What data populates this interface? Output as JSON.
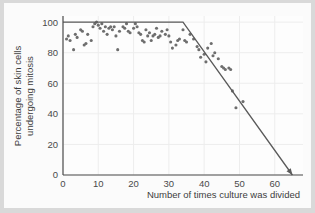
{
  "figure": {
    "background_color": "#fbfbfb",
    "page_color": "#d9d9d9",
    "ink_color": "#5a5a5a",
    "point_color": "#6e6e6e"
  },
  "axes": {
    "x_title": "Number of times culture was divided",
    "y_title_line1": "Percentage of skin cells",
    "y_title_line2": "undergoing mitosis",
    "x_ticks": [
      "0",
      "10",
      "20",
      "30",
      "40",
      "50",
      "60"
    ],
    "y_ticks": [
      "0",
      "20",
      "40",
      "60",
      "80",
      "100"
    ]
  },
  "chart_data": {
    "type": "scatter",
    "title": "",
    "xlabel": "Number of times culture was divided",
    "ylabel": "Percentage of skin cells undergoing mitosis",
    "xlim": [
      0,
      68
    ],
    "ylim": [
      0,
      104
    ],
    "xticks": [
      0,
      10,
      20,
      30,
      40,
      50,
      60
    ],
    "yticks": [
      0,
      20,
      40,
      60,
      80,
      100
    ],
    "grid": true,
    "legend": "none",
    "series": [
      {
        "name": "Observed mitotic cells",
        "type": "scatter",
        "marker": "filled-circle",
        "color": "#6e6e6e",
        "points": [
          [
            1,
            89
          ],
          [
            1.5,
            91
          ],
          [
            2,
            88
          ],
          [
            3,
            82
          ],
          [
            3.5,
            92
          ],
          [
            4,
            90
          ],
          [
            5,
            95
          ],
          [
            5.5,
            94
          ],
          [
            6,
            85
          ],
          [
            6.5,
            86
          ],
          [
            7,
            92
          ],
          [
            8,
            88
          ],
          [
            8.5,
            97
          ],
          [
            9,
            99
          ],
          [
            9.5,
            100
          ],
          [
            10,
            98
          ],
          [
            10.5,
            96
          ],
          [
            11,
            99
          ],
          [
            11.5,
            94
          ],
          [
            12,
            97
          ],
          [
            12.5,
            92
          ],
          [
            13,
            96
          ],
          [
            13.5,
            97
          ],
          [
            14,
            95
          ],
          [
            14.5,
            97
          ],
          [
            15,
            91
          ],
          [
            15.5,
            82
          ],
          [
            16,
            94
          ],
          [
            17,
            97
          ],
          [
            17.5,
            96
          ],
          [
            18,
            99
          ],
          [
            18.5,
            94
          ],
          [
            19,
            93
          ],
          [
            20,
            96
          ],
          [
            20.5,
            99
          ],
          [
            21,
            97
          ],
          [
            21.5,
            93
          ],
          [
            22,
            92
          ],
          [
            22.5,
            88
          ],
          [
            23,
            87
          ],
          [
            23.5,
            95
          ],
          [
            24,
            91
          ],
          [
            24.5,
            93
          ],
          [
            25,
            88
          ],
          [
            25.5,
            91
          ],
          [
            26,
            92
          ],
          [
            26.5,
            96
          ],
          [
            27,
            90
          ],
          [
            27.5,
            91
          ],
          [
            28,
            94
          ],
          [
            29,
            92
          ],
          [
            29.5,
            95
          ],
          [
            30,
            91
          ],
          [
            30.5,
            87
          ],
          [
            31,
            83
          ],
          [
            32,
            85
          ],
          [
            32.5,
            88
          ],
          [
            33,
            89
          ],
          [
            34,
            95
          ],
          [
            34.5,
            88
          ],
          [
            35,
            87
          ],
          [
            36,
            92
          ],
          [
            37,
            89
          ],
          [
            38,
            84
          ],
          [
            38.5,
            82
          ],
          [
            39,
            77
          ],
          [
            40,
            79
          ],
          [
            40.5,
            74
          ],
          [
            41,
            83
          ],
          [
            42,
            86
          ],
          [
            42.5,
            78
          ],
          [
            43,
            80
          ],
          [
            44,
            76
          ],
          [
            45,
            71
          ],
          [
            45.5,
            70
          ],
          [
            46,
            69
          ],
          [
            47,
            70
          ],
          [
            47.5,
            69
          ],
          [
            48,
            55
          ],
          [
            49,
            44
          ],
          [
            51,
            48
          ]
        ]
      },
      {
        "name": "Fitted trend",
        "type": "line",
        "color": "#5a5a5a",
        "arrow_end": true,
        "vertices": [
          [
            0,
            100
          ],
          [
            34,
            100
          ],
          [
            65,
            0
          ]
        ]
      }
    ]
  }
}
